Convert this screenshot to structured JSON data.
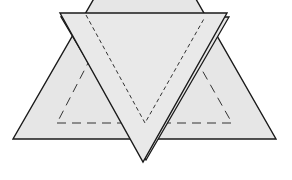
{
  "diagram": {
    "colors": {
      "paper_fill": "#e6e6e6",
      "paper_fill_front": "#e9e9e9",
      "stroke": "#1a1a1a",
      "dashed_stroke": "#333333",
      "background": "#ffffff"
    },
    "shapes": {
      "upright_triangle": {
        "points": "13,139 276,139 218,37 70,37",
        "description": "Background triangle whose apex is hidden behind the inverted triangle"
      },
      "upright_inner_dashed": {
        "points": "57,123 232,123 185,40 100,40",
        "description": "Dashed fold line inside the upright triangle"
      },
      "inverted_triangle_back": {
        "points": "61,17 229,17 146,160",
        "description": "Back layer of the inverted triangle (doubled edge)"
      },
      "inverted_triangle_front": {
        "points": "60,13 227,13 143,162",
        "description": "Front inverted triangle"
      },
      "inverted_inner_dashed": {
        "points": "86,15 145,123 205,17",
        "description": "Dashed V-shaped fold line inside the inverted triangle"
      }
    }
  }
}
